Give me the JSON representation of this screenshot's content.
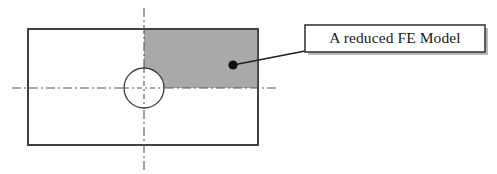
{
  "figure": {
    "canvas": {
      "width": 497,
      "height": 174,
      "background": "#ffffff"
    }
  },
  "colors": {
    "outline": "#3a3a3a",
    "shaded_region_fill": "#a9a9a9",
    "centerline": "#555555",
    "leader_line": "#1f1f1f",
    "marker_dot": "#111111",
    "callout_border": "#3a3a3a",
    "callout_fill": "#ffffff",
    "callout_shadow": "#b8b8b8",
    "text": "#1a1a1a"
  },
  "plate": {
    "name": "plate-outline",
    "x": 28,
    "y": 29,
    "width": 230,
    "height": 116,
    "stroke_width": 1.6
  },
  "shaded_region": {
    "name": "reduced-model-region",
    "x": 144,
    "y": 30,
    "width": 114,
    "height": 58,
    "fill": "#a9a9a9"
  },
  "hole": {
    "name": "center-hole",
    "cx": 144,
    "cy": 88,
    "r": 20,
    "stroke_width": 1.3
  },
  "centerlines": {
    "vertical": {
      "x": 144,
      "y1": 8,
      "y2": 170
    },
    "horizontal": {
      "y": 88,
      "x1": 12,
      "x2": 277
    },
    "dash_pattern": "9 3 2 3",
    "stroke_width": 1.1
  },
  "leader": {
    "name": "callout-leader-line",
    "from_x": 233,
    "from_y": 65,
    "to_x": 305,
    "to_y": 51,
    "stroke_width": 1.7,
    "dot_r": 4.6
  },
  "callout": {
    "name": "callout-box",
    "label": "A reduced FE Model",
    "x": 305,
    "y": 25,
    "width": 180,
    "height": 27,
    "shadow_offset": 3,
    "border_width": 1.6,
    "text_x": 395,
    "text_y": 39.5
  }
}
